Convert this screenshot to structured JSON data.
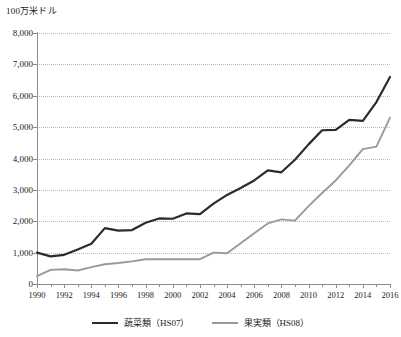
{
  "chart_data": {
    "type": "line",
    "title": "",
    "subtitle": "",
    "ylabel": "100万米ドル",
    "xlabel": "",
    "ylim": [
      0,
      8000
    ],
    "ytick_labels": [
      "8,000",
      "7,000",
      "6,000",
      "5,000",
      "4,000",
      "3,000",
      "2,000",
      "1,000",
      "0"
    ],
    "ytick_values": [
      8000,
      7000,
      6000,
      5000,
      4000,
      3000,
      2000,
      1000,
      0
    ],
    "xlim": [
      1990,
      2016
    ],
    "x": [
      1990,
      1991,
      1992,
      1993,
      1994,
      1995,
      1996,
      1997,
      1998,
      1999,
      2000,
      2001,
      2002,
      2003,
      2004,
      2005,
      2006,
      2007,
      2008,
      2009,
      2010,
      2011,
      2012,
      2013,
      2014,
      2015,
      2016
    ],
    "xtick_labels": [
      "1990",
      "1992",
      "1994",
      "1996",
      "1998",
      "2000",
      "2002",
      "2004",
      "2006",
      "2008",
      "2010",
      "2012",
      "2014",
      "2016"
    ],
    "grid": "horizontal-dotted",
    "legend_position": "bottom-center",
    "series": [
      {
        "name": "蔬菜類（HS07）",
        "color": "#2b2b2b",
        "values": [
          1000,
          880,
          930,
          1100,
          1280,
          1780,
          1700,
          1720,
          1950,
          2090,
          2080,
          2250,
          2230,
          2560,
          2840,
          3060,
          3300,
          3620,
          3560,
          3960,
          4450,
          4900,
          4910,
          5230,
          5200,
          5800,
          6600
        ]
      },
      {
        "name": "果実類（HS08）",
        "color": "#9a9a9a",
        "values": [
          250,
          450,
          470,
          430,
          540,
          630,
          670,
          720,
          790,
          790,
          790,
          790,
          790,
          1000,
          980,
          1300,
          1620,
          1930,
          2060,
          2020,
          2480,
          2900,
          3300,
          3780,
          4300,
          4380,
          5300
        ]
      }
    ]
  }
}
